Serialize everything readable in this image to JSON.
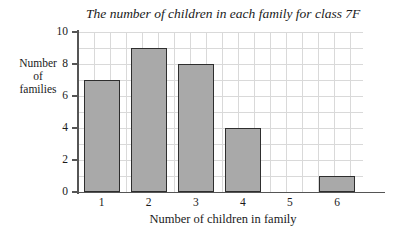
{
  "chart_data": {
    "type": "bar",
    "title": "The number of children in each family for class 7F",
    "xlabel": "Number of children in family",
    "ylabel": "Number of families",
    "ylabel_lines": [
      "Number",
      "of",
      "families"
    ],
    "categories": [
      "1",
      "2",
      "3",
      "4",
      "5",
      "6"
    ],
    "values": [
      7,
      9,
      8,
      4,
      0,
      1
    ],
    "ylim": [
      0,
      10
    ],
    "y_ticks": [
      "0",
      "2",
      "4",
      "6",
      "8",
      "10"
    ],
    "y_tick_values": [
      0,
      2,
      4,
      6,
      8,
      10
    ],
    "y_minor_step": 1,
    "grid": true,
    "legend": "none",
    "bar_fill_color": "#a9a9a9",
    "bar_border_color": "#2e2e2e",
    "grid_color": "#d9d9d9",
    "axis_color": "#555555",
    "background_color": "#ffffff"
  }
}
